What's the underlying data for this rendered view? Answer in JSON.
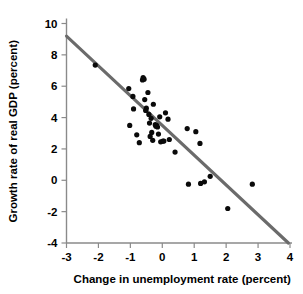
{
  "chart_data": {
    "type": "scatter",
    "title": "",
    "xlabel": "Change in unemployment rate (percent)",
    "ylabel": "Growth rate of real GDP (percent)",
    "xlim": [
      -3,
      4
    ],
    "ylim": [
      -4,
      10
    ],
    "xticks": [
      -3,
      -2,
      -1,
      0,
      1,
      2,
      3,
      4
    ],
    "yticks": [
      -4,
      -2,
      0,
      2,
      4,
      6,
      8,
      10
    ],
    "xtick_labels": [
      "-3",
      "-2",
      "-1",
      "0",
      "1",
      "2",
      "3",
      "4"
    ],
    "ytick_labels": [
      "-4",
      "-2",
      "0",
      "2",
      "4",
      "6",
      "8",
      "10"
    ],
    "grid": false,
    "legend": null,
    "point_color": "#0a0a0a",
    "line_color": "#6b6b6b",
    "axis_color": "#8a8a8a",
    "points": [
      {
        "x": -2.1,
        "y": 7.35
      },
      {
        "x": -1.05,
        "y": 5.85
      },
      {
        "x": -0.92,
        "y": 5.35
      },
      {
        "x": -0.9,
        "y": 4.55
      },
      {
        "x": -1.02,
        "y": 3.5
      },
      {
        "x": -0.8,
        "y": 2.9
      },
      {
        "x": -0.72,
        "y": 2.4
      },
      {
        "x": -0.6,
        "y": 6.55
      },
      {
        "x": -0.62,
        "y": 6.4
      },
      {
        "x": -0.57,
        "y": 6.45
      },
      {
        "x": -0.55,
        "y": 5.15
      },
      {
        "x": -0.5,
        "y": 4.6
      },
      {
        "x": -0.52,
        "y": 4.45
      },
      {
        "x": -0.45,
        "y": 5.6
      },
      {
        "x": -0.42,
        "y": 4.2
      },
      {
        "x": -0.4,
        "y": 3.65
      },
      {
        "x": -0.38,
        "y": 2.8
      },
      {
        "x": -0.35,
        "y": 3.95
      },
      {
        "x": -0.33,
        "y": 3.05
      },
      {
        "x": -0.3,
        "y": 2.55
      },
      {
        "x": -0.28,
        "y": 4.85
      },
      {
        "x": -0.22,
        "y": 3.55
      },
      {
        "x": -0.2,
        "y": 3.45
      },
      {
        "x": -0.18,
        "y": 3.5
      },
      {
        "x": -0.15,
        "y": 3.4
      },
      {
        "x": -0.12,
        "y": 2.95
      },
      {
        "x": -0.08,
        "y": 4.05
      },
      {
        "x": -0.05,
        "y": 2.45
      },
      {
        "x": 0.02,
        "y": 2.5
      },
      {
        "x": 0.05,
        "y": 2.5
      },
      {
        "x": 0.1,
        "y": 4.3
      },
      {
        "x": 0.18,
        "y": 3.9
      },
      {
        "x": 0.22,
        "y": 2.6
      },
      {
        "x": 0.4,
        "y": 1.8
      },
      {
        "x": 0.78,
        "y": 3.3
      },
      {
        "x": 0.82,
        "y": -0.25
      },
      {
        "x": 1.05,
        "y": 3.1
      },
      {
        "x": 1.18,
        "y": 2.35
      },
      {
        "x": 1.2,
        "y": -0.2
      },
      {
        "x": 1.32,
        "y": -0.1
      },
      {
        "x": 1.5,
        "y": 0.25
      },
      {
        "x": 2.05,
        "y": -1.8
      },
      {
        "x": 2.82,
        "y": -0.25
      }
    ],
    "trend_line": {
      "x1": -3,
      "y1": 9.2,
      "x2": 3.95,
      "y2": -4.0
    }
  }
}
